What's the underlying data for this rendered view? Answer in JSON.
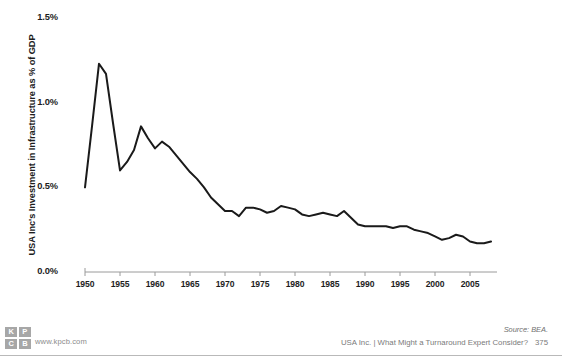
{
  "chart_data": {
    "type": "line",
    "title": "",
    "subtitle": "",
    "xlabel": "",
    "ylabel": "USA Inc's Investment in Infrastructure as % of GDP",
    "xlim": [
      1950,
      2008
    ],
    "ylim": [
      0.0,
      1.5
    ],
    "grid": false,
    "legend": "none",
    "y_tick_labels": [
      "1.5%",
      "1.0%",
      "0.5%",
      "0.0%"
    ],
    "y_tick_values": [
      1.5,
      1.0,
      0.5,
      0.0
    ],
    "x_tick_labels": [
      "1950",
      "1955",
      "1960",
      "1965",
      "1970",
      "1975",
      "1980",
      "1985",
      "1990",
      "1995",
      "2000",
      "2005"
    ],
    "x_tick_values": [
      1950,
      1955,
      1960,
      1965,
      1970,
      1975,
      1980,
      1985,
      1990,
      1995,
      2000,
      2005
    ],
    "series": [
      {
        "name": "USA Inc's Investment in Infrastructure as % of GDP",
        "color": "#1a1a1a",
        "x": [
          1950,
          1951,
          1952,
          1953,
          1954,
          1955,
          1956,
          1957,
          1958,
          1959,
          1960,
          1961,
          1962,
          1963,
          1964,
          1965,
          1966,
          1967,
          1968,
          1969,
          1970,
          1971,
          1972,
          1973,
          1974,
          1975,
          1976,
          1977,
          1978,
          1979,
          1980,
          1981,
          1982,
          1983,
          1984,
          1985,
          1986,
          1987,
          1988,
          1989,
          1990,
          1991,
          1992,
          1993,
          1994,
          1995,
          1996,
          1997,
          1998,
          1999,
          2000,
          2001,
          2002,
          2003,
          2004,
          2005,
          2006,
          2007,
          2008
        ],
        "y": [
          0.5,
          0.86,
          1.23,
          1.17,
          0.88,
          0.6,
          0.65,
          0.72,
          0.86,
          0.79,
          0.73,
          0.77,
          0.74,
          0.69,
          0.64,
          0.59,
          0.55,
          0.5,
          0.44,
          0.4,
          0.36,
          0.36,
          0.33,
          0.38,
          0.38,
          0.37,
          0.35,
          0.36,
          0.39,
          0.38,
          0.37,
          0.34,
          0.33,
          0.34,
          0.35,
          0.34,
          0.33,
          0.36,
          0.32,
          0.28,
          0.27,
          0.27,
          0.27,
          0.27,
          0.26,
          0.27,
          0.27,
          0.25,
          0.24,
          0.23,
          0.21,
          0.19,
          0.2,
          0.22,
          0.21,
          0.18,
          0.17,
          0.17,
          0.18
        ]
      }
    ]
  },
  "axis": {
    "y_label": "USA Inc's Investment in Infrastructure as % of GDP"
  },
  "footer": {
    "logo_cells": [
      "K",
      "P",
      "C",
      "B"
    ],
    "url": "www.kpcb.com",
    "source": "Source: BEA.",
    "deck": "USA Inc. | What Might a Turnaround Expert Consider?",
    "page": "375"
  }
}
